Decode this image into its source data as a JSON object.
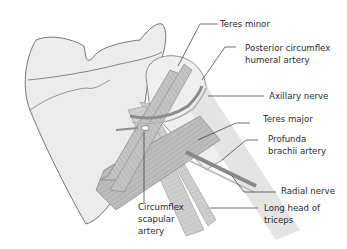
{
  "diagram": {
    "colors": {
      "bone_fill": "#ececec",
      "bone_stroke": "#555555",
      "muscle_fill": "#b8b8b8",
      "muscle_light": "#d6d6d6",
      "artery": "#8c8c8c",
      "leader": "#333333",
      "text": "#2b2b2b"
    },
    "labels": {
      "teres_minor": "Teres minor",
      "post_circ_1": "Posterior circumflex",
      "post_circ_2": "humeral artery",
      "axillary_nerve": "Axillary nerve",
      "teres_major": "Teres major",
      "profunda_1": "Profunda",
      "profunda_2": "brachii artery",
      "radial_nerve": "Radial nerve",
      "long_head_1": "Long head of",
      "long_head_2": "triceps",
      "circ_scap_1": "Circumflex",
      "circ_scap_2": "scapular",
      "circ_scap_3": "artery"
    }
  }
}
